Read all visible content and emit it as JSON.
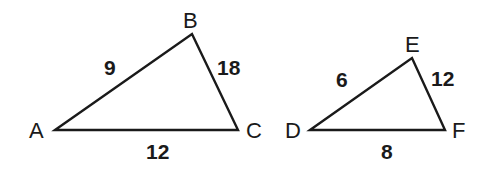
{
  "diagram": {
    "stroke_color": "#1a1a1a",
    "triangles": [
      {
        "name": "ABC",
        "vertices": [
          {
            "label": "A",
            "x": 55,
            "y": 130
          },
          {
            "label": "B",
            "x": 192,
            "y": 34
          },
          {
            "label": "C",
            "x": 238,
            "y": 130
          }
        ],
        "sides": [
          {
            "between": "AB",
            "length": "9"
          },
          {
            "between": "BC",
            "length": "18"
          },
          {
            "between": "AC",
            "length": "12"
          }
        ]
      },
      {
        "name": "DEF",
        "vertices": [
          {
            "label": "D",
            "x": 310,
            "y": 130
          },
          {
            "label": "E",
            "x": 412,
            "y": 58
          },
          {
            "label": "F",
            "x": 445,
            "y": 130
          }
        ],
        "sides": [
          {
            "between": "DE",
            "length": "6"
          },
          {
            "between": "EF",
            "length": "12"
          },
          {
            "between": "DF",
            "length": "8"
          }
        ]
      }
    ]
  }
}
